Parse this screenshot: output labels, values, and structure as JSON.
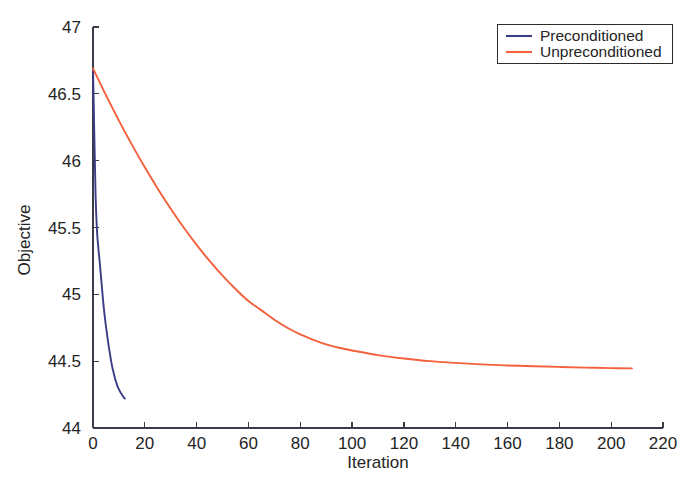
{
  "chart_data": {
    "type": "line",
    "title": "",
    "xlabel": "Iteration",
    "ylabel": "Objective",
    "xlim": [
      0,
      220
    ],
    "ylim": [
      44,
      47
    ],
    "xticks": [
      0,
      20,
      40,
      60,
      80,
      100,
      120,
      140,
      160,
      180,
      200,
      220
    ],
    "xtick_labels": [
      "0",
      "20",
      "40",
      "60",
      "80",
      "100",
      "120",
      "140",
      "160",
      "180",
      "200",
      "220"
    ],
    "yticks": [
      44,
      44.5,
      45,
      45.5,
      46,
      46.5,
      47
    ],
    "ytick_labels": [
      "44",
      "44.5",
      "45",
      "45.5",
      "46",
      "46.5",
      "47"
    ],
    "grid": false,
    "legend_position": "top-right",
    "series": [
      {
        "name": "Preconditioned",
        "color": "#3c3c86",
        "x": [
          0,
          0.5,
          1,
          1.5,
          2,
          2.5,
          3,
          3.5,
          4,
          4.5,
          5,
          5.5,
          6,
          6.5,
          7,
          7.5,
          8,
          8.5,
          9,
          9.5,
          10,
          10.5,
          11,
          11.5,
          12,
          12.3
        ],
        "y": [
          46.69,
          46.2,
          45.74,
          45.49,
          45.36,
          45.26,
          45.15,
          45.04,
          44.93,
          44.84,
          44.76,
          44.69,
          44.62,
          44.56,
          44.5,
          44.45,
          44.41,
          44.37,
          44.34,
          44.31,
          44.29,
          44.27,
          44.255,
          44.24,
          44.225,
          44.22
        ]
      },
      {
        "name": "Unpreconditioned",
        "color": "#f4603c",
        "x": [
          0,
          5,
          10,
          15,
          20,
          25,
          30,
          35,
          40,
          45,
          50,
          55,
          60,
          65,
          70,
          75,
          80,
          85,
          90,
          95,
          100,
          110,
          120,
          130,
          140,
          150,
          160,
          170,
          180,
          190,
          200,
          208
        ],
        "y": [
          46.69,
          46.49,
          46.3,
          46.12,
          45.95,
          45.79,
          45.64,
          45.5,
          45.37,
          45.25,
          45.14,
          45.04,
          44.95,
          44.88,
          44.81,
          44.75,
          44.7,
          44.66,
          44.625,
          44.6,
          44.58,
          44.545,
          44.52,
          44.5,
          44.487,
          44.476,
          44.468,
          44.462,
          44.457,
          44.452,
          44.448,
          44.446
        ]
      }
    ]
  },
  "legend": {
    "entries": [
      {
        "label": "Preconditioned",
        "color": "#3c3c86"
      },
      {
        "label": "Unpreconditioned",
        "color": "#f4603c"
      }
    ]
  },
  "axes": {
    "x_title": "Iteration",
    "y_title": "Objective"
  }
}
